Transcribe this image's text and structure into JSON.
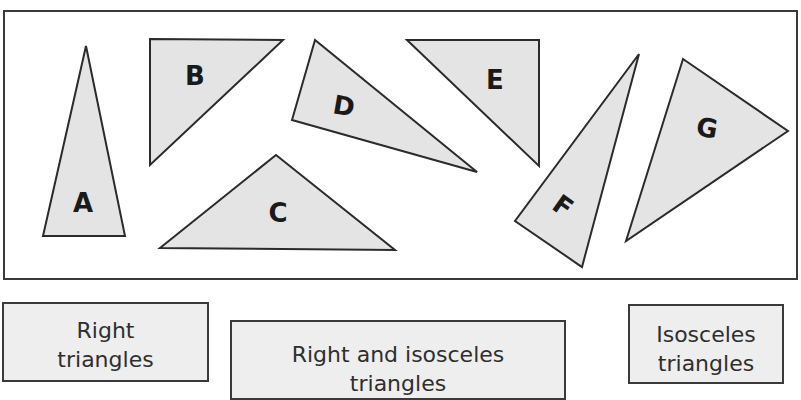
{
  "triangles": [
    {
      "id": "A",
      "label": "A",
      "points": "86,46 43,236 125,236",
      "label_pos": [
        83,
        203
      ],
      "rotate": 0
    },
    {
      "id": "B",
      "label": "B",
      "points": "150,39 283,40 150,165",
      "label_pos": [
        195,
        76
      ],
      "rotate": 0
    },
    {
      "id": "C",
      "label": "C",
      "points": "276,155 160,248 395,250",
      "label_pos": [
        278,
        213
      ],
      "rotate": 0
    },
    {
      "id": "D",
      "label": "D",
      "points": "315,40 292,120 477,172",
      "label_pos": [
        344,
        106
      ],
      "rotate": 10
    },
    {
      "id": "E",
      "label": "E",
      "points": "407,40 539,40 539,166",
      "label_pos": [
        495,
        80
      ],
      "rotate": 0
    },
    {
      "id": "F",
      "label": "F",
      "points": "639,54 515,221 582,267",
      "label_pos": [
        563,
        206
      ],
      "rotate": 35
    },
    {
      "id": "G",
      "label": "G",
      "points": "683,59 788,131 626,241",
      "label_pos": [
        707,
        128
      ],
      "rotate": 10
    }
  ],
  "categories": [
    {
      "id": "right",
      "line1": "Right",
      "line2": "triangles"
    },
    {
      "id": "right-isosceles",
      "line1": "Right and isosceles",
      "line2": "triangles"
    },
    {
      "id": "isosceles",
      "line1": "Isosceles",
      "line2": "triangles"
    }
  ],
  "colors": {
    "triangle_fill": "#e4e4e4",
    "stroke": "#2b2b2b",
    "box_fill": "#eeeeee"
  }
}
